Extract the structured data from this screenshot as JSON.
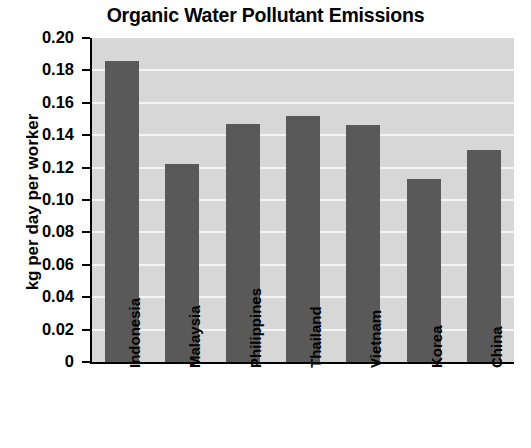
{
  "chart_data": {
    "type": "bar",
    "title": "Organic Water Pollutant Emissions",
    "xlabel": "",
    "ylabel": "kg per day per worker",
    "categories": [
      "Indonesia",
      "Malaysia",
      "Philippines",
      "Thailand",
      "Vietnam",
      "Korea",
      "China"
    ],
    "values": [
      0.186,
      0.122,
      0.147,
      0.152,
      0.146,
      0.113,
      0.131
    ],
    "ylim": [
      0,
      0.2
    ],
    "ytick_labels": [
      "0.20",
      "0.18",
      "0.16",
      "0.14",
      "0.12",
      "0.10",
      "0.08",
      "0.06",
      "0.04",
      "0.02",
      "0"
    ],
    "ytick_values": [
      0.2,
      0.18,
      0.16,
      0.14,
      0.12,
      0.1,
      0.08,
      0.06,
      0.04,
      0.02,
      0
    ],
    "grid": true,
    "legend": false,
    "colors": {
      "bar": "#595959",
      "plot_background": "#d7d7d7",
      "gridline": "#f4f4f4",
      "axis": "#000000",
      "text": "#000000",
      "page_background": "#ffffff"
    }
  }
}
